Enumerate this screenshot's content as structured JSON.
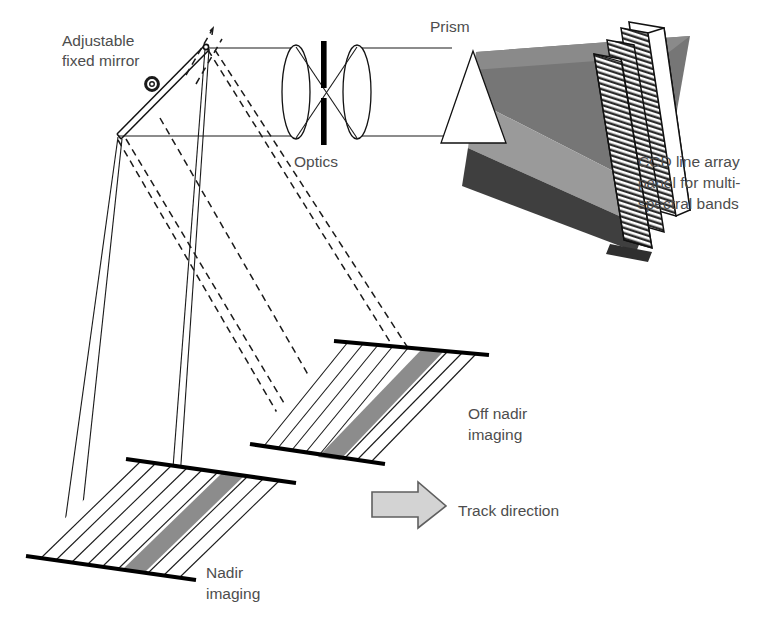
{
  "figure": {
    "background_color": "#ffffff",
    "text_color": "#4d4d4d",
    "line_color": "#111111"
  },
  "labels": {
    "mirror_line1": "Adjustable",
    "mirror_line2": "fixed mirror",
    "optics": "Optics",
    "prism": "Prism",
    "ccd_line1": "CCD line array",
    "ccd_line2": "panel for multi-",
    "ccd_line3": "spectral bands",
    "off_nadir_line1": "Off nadir",
    "off_nadir_line2": "imaging",
    "nadir_line1": "Nadir",
    "nadir_line2": "imaging",
    "track_direction": "Track direction"
  },
  "components": {
    "mirror": {
      "name": "adjustable fixed mirror",
      "pivot_marker": "circle",
      "apex": [
        205,
        47
      ],
      "base": [
        118,
        137
      ]
    },
    "optics": {
      "name": "two-lens relay with slit",
      "lens_count": 2,
      "slit": "vertical field stop"
    },
    "prism": {
      "name": "dispersing prism",
      "apex": [
        473,
        51
      ],
      "base_left": [
        450,
        142
      ],
      "base_right": [
        505,
        142
      ]
    },
    "ccd_panel": {
      "name": "CCD line array panel",
      "array_count": 3,
      "hatch": "fine diagonal stripes",
      "fan_colors": [
        "#8f8f8f",
        "#6e6e6e",
        "#3c3c3c"
      ]
    },
    "ground_patches": [
      {
        "name": "nadir imaging",
        "swath_color": "#8c8c8c",
        "stripe_count": 11
      },
      {
        "name": "off nadir imaging",
        "swath_color": "#8c8c8c",
        "stripe_count": 11
      }
    ],
    "track_arrow": {
      "name": "track direction arrow",
      "fill": "#d0d0d0",
      "stroke": "#5a5a5a",
      "direction": "right"
    }
  },
  "ray_paths": {
    "solid_rays": "nadir view cone from mirror to nadir patch",
    "dashed_rays": "off-nadir view cone from mirror to off-nadir patch"
  }
}
